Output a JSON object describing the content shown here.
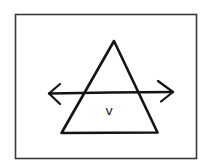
{
  "diagram": {
    "triangle_label": "v",
    "shapes": {
      "frame": "rectangle",
      "triangle": "triangle",
      "arrow": "double-headed horizontal arrow"
    },
    "colors": {
      "ink": "#141414",
      "frame": "#3a3a3a",
      "background": "#ffffff"
    }
  }
}
